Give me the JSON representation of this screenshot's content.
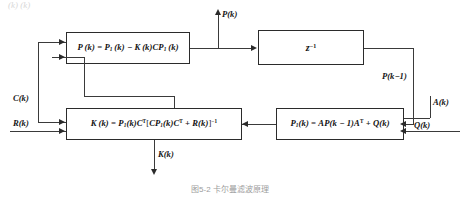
{
  "figure": {
    "type": "block-diagram",
    "caption": "图5-2 卡尔曼滤波原理",
    "top_partial_text": "(k)        (k)"
  },
  "blocks": [
    {
      "id": "box-p",
      "name": "posterior-covariance-block",
      "formula_plain": "P(k) = P1(k) - K(k)CP1(k)",
      "parts": [
        "P",
        "(k)",
        " = ",
        "P",
        "1",
        "(k)",
        " − ",
        "K",
        "(k)",
        "C",
        "P",
        "1",
        "(k)"
      ]
    },
    {
      "id": "box-z",
      "name": "unit-delay-block",
      "formula_plain": "z^-1",
      "base": "z",
      "exponent": "−1"
    },
    {
      "id": "box-k",
      "name": "kalman-gain-block",
      "formula_plain": "K(k) = P1(k)Cᵀ[CP1(k)Cᵀ + R(k)]⁻¹"
    },
    {
      "id": "box-p1",
      "name": "prior-covariance-block",
      "formula_plain": "P1(k) = AP(k−1)Aᵀ + Q(k)"
    }
  ],
  "signals": {
    "output_top": "P(k)",
    "output_bottom": "K(k)",
    "delay_output": "P(k−1)",
    "input_c": "C(k)",
    "input_r": "R(k)",
    "input_a": "A(k)",
    "input_q": "Q(k)"
  },
  "colors": {
    "line": "#3a3a3a",
    "border": "#2b2b2b",
    "text": "#161616",
    "background": "#ffffff",
    "caption": "#9c9c9c"
  }
}
